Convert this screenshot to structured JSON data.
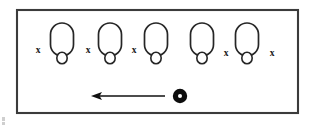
{
  "figure": {
    "type": "diagram",
    "title": "",
    "canvas": {
      "width": 310,
      "height": 126,
      "background": "#ffffff"
    },
    "frame": {
      "label": "bounding-frame",
      "x": 17,
      "y": 10,
      "width": 281,
      "height": 103,
      "stroke_color": "#3b3b3b",
      "stroke_width": 2.1,
      "fill": "#ffffff"
    },
    "shapes": {
      "kind": "capsule-with-foot-circle",
      "count": 5,
      "stroke_color": "#262626",
      "fill": "#ffffff",
      "items": [
        {
          "id": "shape-1",
          "cx": 62,
          "body_top": 23,
          "body_width": 23,
          "body_height": 33,
          "foot_cy": 58,
          "foot_r": 5.2
        },
        {
          "id": "shape-2",
          "cx": 110,
          "body_top": 23,
          "body_width": 23,
          "body_height": 33,
          "foot_cy": 58,
          "foot_r": 5.2
        },
        {
          "id": "shape-3",
          "cx": 156,
          "body_top": 23,
          "body_width": 23,
          "body_height": 33,
          "foot_cy": 58,
          "foot_r": 5.2
        },
        {
          "id": "shape-4",
          "cx": 202,
          "body_top": 23,
          "body_width": 23,
          "body_height": 33,
          "foot_cy": 58,
          "foot_r": 5.2
        },
        {
          "id": "shape-5",
          "cx": 247,
          "body_top": 23,
          "body_width": 23,
          "body_height": 33,
          "foot_cy": 58,
          "foot_r": 5.2
        }
      ]
    },
    "x_marks": {
      "glyph": "x",
      "count": 5,
      "color": "#1a1a1a",
      "items": [
        {
          "id": "x-mark-1",
          "text": "x",
          "cx": 38,
          "cy": 51
        },
        {
          "id": "x-mark-2",
          "text": "x",
          "cx": 88,
          "cy": 51
        },
        {
          "id": "x-mark-3",
          "text": "x",
          "cx": 134,
          "cy": 51
        },
        {
          "id": "x-mark-4",
          "text": "x",
          "cx": 226,
          "cy": 54
        },
        {
          "id": "x-mark-5",
          "text": "x",
          "cx": 272,
          "cy": 54
        }
      ]
    },
    "arrow": {
      "label": "leftward-motion-arrow",
      "direction": "left",
      "color": "#111111",
      "tail_x": 165,
      "tip_x": 91,
      "y": 96,
      "head_length": 11,
      "head_half_width": 4
    },
    "bullseye": {
      "label": "origin-marker-dot",
      "cx": 180,
      "cy": 96,
      "outer_r": 7.2,
      "inner_r": 2.0,
      "outer_color": "#0d0d0d",
      "inner_color": "#ffffff"
    },
    "artifacts": [
      {
        "id": "scan-speck-bottom-left",
        "x": 2,
        "y": 117,
        "width": 3,
        "height": 4,
        "color": "#cfcfcf"
      },
      {
        "id": "scan-speck-bottom-left-2",
        "x": 2,
        "y": 122,
        "width": 3,
        "height": 3,
        "color": "#cfcfcf"
      }
    ]
  }
}
